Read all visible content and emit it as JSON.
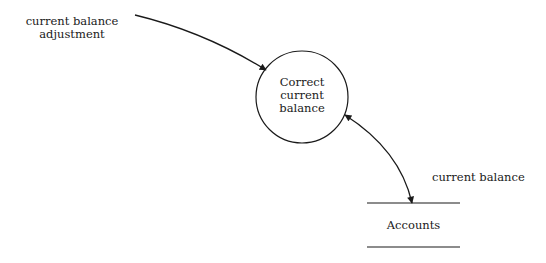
{
  "diagram": {
    "type": "data-flow-diagram",
    "external_flow": {
      "label_line1": "current balance",
      "label_line2": "adjustment"
    },
    "process": {
      "label_line1": "Correct",
      "label_line2": "current",
      "label_line3": "balance"
    },
    "data_store": {
      "label": "Accounts"
    },
    "store_flow": {
      "label": "current balance",
      "direction": "bidirectional"
    },
    "colors": {
      "stroke": "#1a1a1a",
      "background": "#ffffff"
    }
  }
}
